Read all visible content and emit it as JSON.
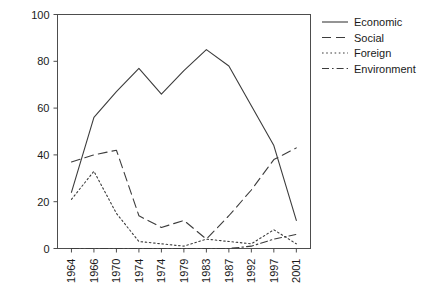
{
  "chart_data": {
    "type": "line",
    "title": "",
    "subtitle": "",
    "xlabel": "",
    "ylabel": "",
    "categories": [
      "1964",
      "1966",
      "1970",
      "1974",
      "1974",
      "1979",
      "1983",
      "1987",
      "1992",
      "1997",
      "2001"
    ],
    "ylim": [
      0,
      100
    ],
    "xlim": [
      0,
      10
    ],
    "yticks": [
      0,
      20,
      40,
      60,
      80,
      100
    ],
    "ytick_labels": [
      "0",
      "20",
      "40",
      "60",
      "80",
      "100"
    ],
    "grid": false,
    "legend_position": "right",
    "series": [
      {
        "name": "Economic",
        "style": "solid",
        "values": [
          24,
          56,
          67,
          77,
          66,
          76,
          85,
          78,
          61,
          44,
          12
        ]
      },
      {
        "name": "Social",
        "style": "dashed",
        "values": [
          37,
          40,
          42,
          14,
          9,
          12,
          4,
          14,
          25,
          38,
          43
        ]
      },
      {
        "name": "Foreign",
        "style": "dotted",
        "values": [
          21,
          33,
          15,
          3,
          2,
          1,
          4,
          3,
          2,
          8,
          2
        ]
      },
      {
        "name": "Environment",
        "style": "dashdot",
        "values": [
          0,
          0,
          0,
          0,
          0,
          0,
          0,
          0,
          1,
          4,
          6
        ]
      }
    ]
  },
  "legend": {
    "entries": [
      {
        "label": "Economic",
        "style": "solid"
      },
      {
        "label": "Social",
        "style": "dashed"
      },
      {
        "label": "Foreign",
        "style": "dotted"
      },
      {
        "label": "Environment",
        "style": "dashdot"
      }
    ]
  },
  "colors": {
    "line": "#3c3c3c",
    "axis": "#4d4d4d",
    "text": "#1a1a1a",
    "background": "#ffffff"
  }
}
